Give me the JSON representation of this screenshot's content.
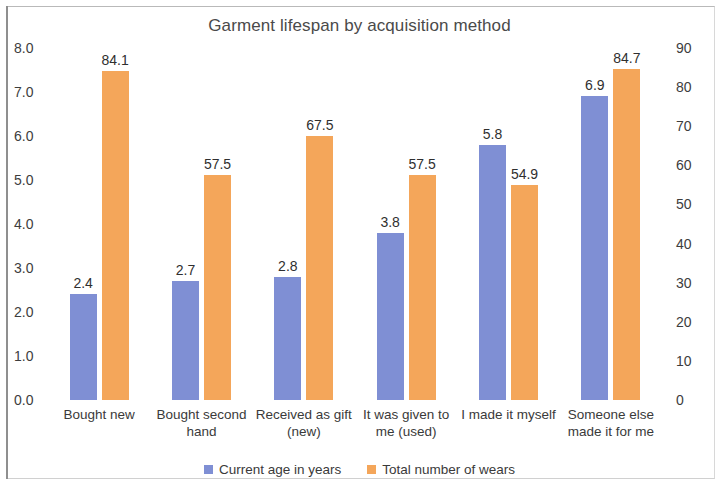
{
  "chart_data": {
    "type": "bar",
    "title": "Garment lifespan by acquisition method",
    "xlabel": "",
    "ylabel": "",
    "grid": false,
    "legend_position": "bottom",
    "categories": [
      "Bought new",
      "Bought second hand",
      "Received as gift (new)",
      "It was given to me (used)",
      "I made it myself",
      "Someone else made it for me"
    ],
    "category_lines": [
      [
        "Bought new"
      ],
      [
        "Bought second",
        "hand"
      ],
      [
        "Received as gift",
        "(new)"
      ],
      [
        "It was given to",
        "me (used)"
      ],
      [
        "I made it myself"
      ],
      [
        "Someone else",
        "made it for me"
      ]
    ],
    "series": [
      {
        "name": "Current age in years",
        "color": "#7f8fd4",
        "axis": "left",
        "values": [
          2.4,
          2.7,
          2.8,
          3.8,
          5.8,
          6.9
        ],
        "labels": [
          "2.4",
          "2.7",
          "2.8",
          "3.8",
          "5.8",
          "6.9"
        ]
      },
      {
        "name": "Total number of wears",
        "color": "#f4a65a",
        "axis": "right",
        "values": [
          84.1,
          57.5,
          67.5,
          57.5,
          54.9,
          84.7
        ],
        "labels": [
          "84.1",
          "57.5",
          "67.5",
          "57.5",
          "54.9",
          "84.7"
        ]
      }
    ],
    "left_axis": {
      "min": 0,
      "max": 8,
      "step": 1,
      "ticks": [
        "0.0",
        "1.0",
        "2.0",
        "3.0",
        "4.0",
        "5.0",
        "6.0",
        "7.0",
        "8.0"
      ]
    },
    "right_axis": {
      "min": 0,
      "max": 90,
      "step": 10,
      "ticks": [
        "0",
        "10",
        "20",
        "30",
        "40",
        "50",
        "60",
        "70",
        "80",
        "90"
      ]
    }
  }
}
